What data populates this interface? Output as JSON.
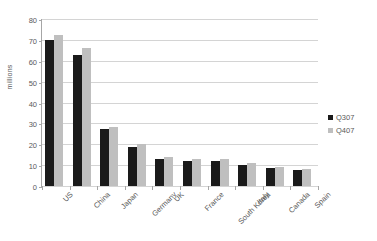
{
  "chart_data": {
    "type": "bar",
    "title": "",
    "xlabel": "",
    "ylabel": "millions",
    "ylim": [
      0,
      80
    ],
    "ytick_step": 10,
    "yticks": [
      "80",
      "70",
      "60",
      "50",
      "40",
      "30",
      "20",
      "10",
      "0"
    ],
    "grid": true,
    "legend_position": "right",
    "categories": [
      "US",
      "China",
      "Japan",
      "Germany",
      "UK",
      "France",
      "South Korea",
      "Italy",
      "Canada",
      "Spain"
    ],
    "series": [
      {
        "name": "Q307",
        "color": "#1a1a1a",
        "values": [
          70.0,
          63.0,
          27.5,
          18.5,
          13.0,
          12.0,
          12.0,
          10.3,
          8.6,
          7.5
        ]
      },
      {
        "name": "Q407",
        "color": "#bfbfbf",
        "values": [
          72.3,
          66.0,
          28.5,
          20.0,
          13.8,
          12.8,
          12.8,
          11.0,
          9.3,
          8.1
        ]
      }
    ]
  }
}
